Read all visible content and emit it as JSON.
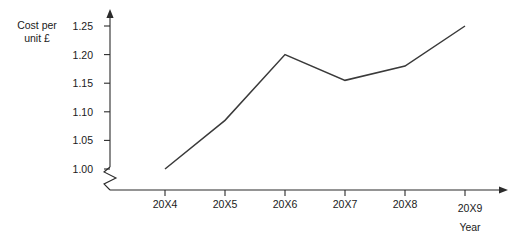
{
  "chart_data": {
    "type": "line",
    "title": "",
    "xlabel": "Year",
    "ylabel_lines": [
      "Cost per",
      "unit £"
    ],
    "ylabel": "Cost per unit £",
    "categories": [
      "20X4",
      "20X5",
      "20X6",
      "20X7",
      "20X8",
      "20X9"
    ],
    "values": [
      1.0,
      1.085,
      1.2,
      1.155,
      1.18,
      1.25
    ],
    "series": [
      {
        "name": "Cost per unit £",
        "values": [
          1.0,
          1.085,
          1.2,
          1.155,
          1.18,
          1.25
        ]
      }
    ],
    "ytick_labels": [
      "1.00",
      "1.05",
      "1.10",
      "1.15",
      "1.20",
      "1.25"
    ],
    "ytick_values": [
      1.0,
      1.05,
      1.1,
      1.15,
      1.2,
      1.25
    ],
    "ylim": [
      1.0,
      1.25
    ],
    "grid": false,
    "legend": false,
    "legend_position": "none",
    "axis_break": true,
    "axis_break_note": "zigzag break on y-axis below 1.00",
    "line_color": "#3a3a3a",
    "axis_color": "#2b2b2b",
    "background_color": "#ffffff",
    "markers": false,
    "x_arrow": true,
    "y_arrow": true
  },
  "geometry": {
    "x_positions": [
      165,
      225,
      285,
      345,
      405,
      465
    ],
    "y_positions": [
      169,
      140.4,
      111.8,
      83.2,
      54.6,
      26
    ],
    "origin_x": 110,
    "axis_bottom_y": 190,
    "axis_top_y": 18,
    "axis_right_x": 505
  }
}
